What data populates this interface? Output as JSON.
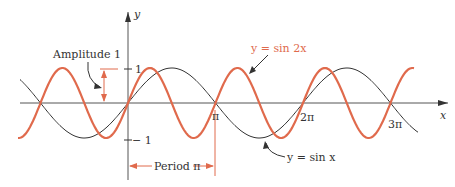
{
  "chart_data": {
    "type": "line",
    "title": "",
    "xlabel": "x",
    "ylabel": "y",
    "x_ticks": [
      "π",
      "2π",
      "3π"
    ],
    "y_ticks": [
      "1",
      "−1"
    ],
    "xlim": [
      -1.47,
      3.62
    ],
    "ylim": [
      -1,
      1
    ],
    "series": [
      {
        "name": "y = sin x",
        "function": "sin(x)",
        "color": "#333333"
      },
      {
        "name": "y = sin 2x",
        "function": "sin(2x)",
        "color": "#e06a4c"
      }
    ],
    "annotations": [
      "Amplitude 1",
      "Period π",
      "y = sin 2x",
      "y = sin x"
    ]
  },
  "labels": {
    "y_axis": "y",
    "x_axis": "x",
    "y_one": "1",
    "y_neg_one": "− 1",
    "pi": "π",
    "two_pi": "2π",
    "three_pi": "3π",
    "amplitude": "Amplitude 1",
    "period": "Period π",
    "sin2x": "y  =  sin 2x",
    "sinx": "y  =  sin x"
  },
  "colors": {
    "accent": "#e06a4c",
    "ink": "#333333"
  }
}
